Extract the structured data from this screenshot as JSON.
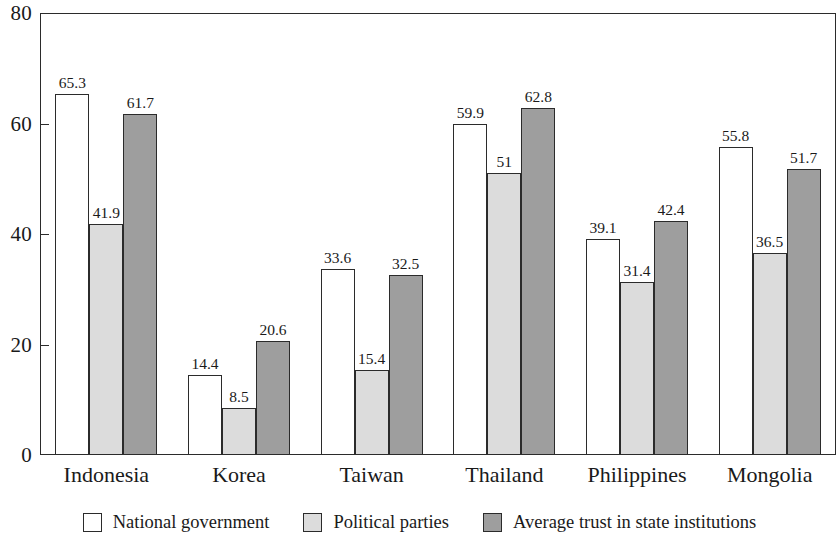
{
  "chart_data": {
    "type": "bar",
    "title": "",
    "subtitle": "",
    "xlabel": "",
    "ylabel": "",
    "ylim": [
      0,
      80
    ],
    "y_ticks": [
      0,
      20,
      40,
      60,
      80
    ],
    "y_tick_labels": [
      "0",
      "20",
      "40",
      "60",
      "80"
    ],
    "grid": false,
    "legend_position": "bottom",
    "categories": [
      "Indonesia",
      "Korea",
      "Taiwan",
      "Thailand",
      "Philippines",
      "Mongolia"
    ],
    "series": [
      {
        "name": "National government",
        "color": "#ffffff",
        "values": [
          65.3,
          14.4,
          33.6,
          59.9,
          39.1,
          55.8
        ],
        "value_labels": [
          "65.3",
          "14.4",
          "33.6",
          "59.9",
          "39.1",
          "55.8"
        ]
      },
      {
        "name": "Political parties",
        "color": "#dcdcdc",
        "values": [
          41.9,
          8.5,
          15.4,
          51,
          31.4,
          36.5
        ],
        "value_labels": [
          "41.9",
          "8.5",
          "15.4",
          "51",
          "31.4",
          "36.5"
        ]
      },
      {
        "name": "Average trust in state institutions",
        "color": "#9e9e9e",
        "values": [
          61.7,
          20.6,
          32.5,
          62.8,
          42.4,
          51.7
        ],
        "value_labels": [
          "61.7",
          "20.6",
          "32.5",
          "62.8",
          "42.4",
          "51.7"
        ]
      }
    ]
  },
  "legend": {
    "items": [
      {
        "label": "National government",
        "swatch": "white-square-swatch"
      },
      {
        "label": "Political parties",
        "swatch": "light-gray-square-swatch"
      },
      {
        "label": "Average trust in state institutions",
        "swatch": "dark-gray-square-swatch"
      }
    ]
  },
  "colors": {
    "axis": "#2b2b2b",
    "series_national_government": "#ffffff",
    "series_political_parties": "#dcdcdc",
    "series_average_trust": "#9e9e9e",
    "background": "#ffffff"
  }
}
